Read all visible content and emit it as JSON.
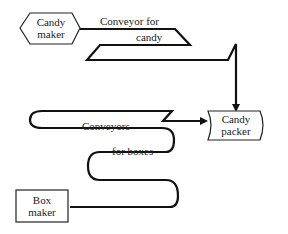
{
  "diagram": {
    "nodes": {
      "candy_maker": {
        "line1": "Candy",
        "line2": "maker"
      },
      "candy_packer": {
        "line1": "Candy",
        "line2": "packer"
      },
      "box_maker": {
        "line1": "Box",
        "line2": "maker"
      }
    },
    "conveyors": {
      "candy_line1": "Conveyor for",
      "candy_line2": "candy",
      "boxes_line1": "Conveyors",
      "boxes_line2": "for boxes"
    },
    "colors": {
      "stroke": "#111111",
      "background": "#ffffff"
    }
  }
}
